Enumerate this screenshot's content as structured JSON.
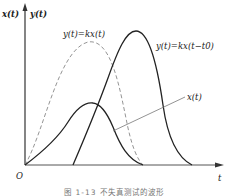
{
  "diagram": {
    "axes": {
      "y_label_left": "x(t)",
      "y_label_right": "y(t)",
      "x_label": "t",
      "origin_label": "O"
    },
    "curves": [
      {
        "name": "ideal-output",
        "label": "y(t)=kx(t)",
        "style": "dashed",
        "color": "#888888"
      },
      {
        "name": "delayed-output",
        "label": "y(t)=kx(t−t0)",
        "style": "solid",
        "color": "#222222"
      },
      {
        "name": "input-signal",
        "label": "x(t)",
        "style": "solid",
        "color": "#222222"
      }
    ],
    "caption": "图 1-13  不失真测试的波形"
  }
}
